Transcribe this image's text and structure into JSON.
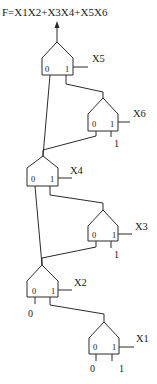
{
  "diagram": {
    "title": "F=X1X2+X3X4+X5X6",
    "muxes": [
      {
        "id": "mux5",
        "select": "X5",
        "port0": "0",
        "port1": "1"
      },
      {
        "id": "mux6",
        "select": "X6",
        "port0": "0",
        "port1": "1",
        "input1_const": "1"
      },
      {
        "id": "mux4",
        "select": "X4",
        "port0": "0",
        "port1": "1"
      },
      {
        "id": "mux3",
        "select": "X3",
        "port0": "0",
        "port1": "1",
        "input1_const": "1"
      },
      {
        "id": "mux2",
        "select": "X2",
        "port0": "0",
        "port1": "1",
        "input0_const": "0"
      },
      {
        "id": "mux1",
        "select": "X1",
        "port0": "0",
        "port1": "1",
        "input0_const": "0",
        "input1_const": "1"
      }
    ],
    "colors": {
      "line": "#2a2a2a",
      "text": "#1a1a1a",
      "background": "#ffffff"
    }
  }
}
